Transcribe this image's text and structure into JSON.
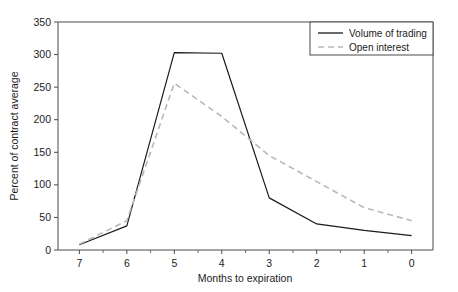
{
  "chart_data": {
    "type": "line",
    "title": "",
    "xlabel": "Months to expiration",
    "ylabel": "Percent of contract average",
    "x": [
      7,
      6,
      5,
      4,
      3,
      2,
      1,
      0
    ],
    "categories": [
      "7",
      "6",
      "5",
      "4",
      "3",
      "2",
      "1",
      "0"
    ],
    "xlim": [
      7.45,
      -0.45
    ],
    "ylim": [
      0,
      350
    ],
    "x_ticks": [
      "7",
      "6",
      "5",
      "4",
      "3",
      "2",
      "1",
      "0"
    ],
    "y_ticks": [
      "0",
      "50",
      "100",
      "150",
      "200",
      "250",
      "300",
      "350"
    ],
    "x_axis_inverted": true,
    "grid": false,
    "legend_position": "top-right",
    "minor_ticks_x": true,
    "series": [
      {
        "name": "Volume of trading",
        "style": "solid",
        "color": "#1a1a1a",
        "values": [
          8,
          37,
          303,
          302,
          80,
          40,
          30,
          22
        ]
      },
      {
        "name": "Open interest",
        "style": "dashed",
        "color": "#b8b8b8",
        "values": [
          9,
          45,
          256,
          205,
          145,
          105,
          65,
          45
        ]
      }
    ]
  },
  "legend": {
    "items": [
      {
        "label": "Volume of trading",
        "style": "solid",
        "color": "#1a1a1a"
      },
      {
        "label": "Open interest",
        "style": "dashed",
        "color": "#b8b8b8"
      }
    ]
  },
  "axes": {
    "y_title": "Percent of contract average",
    "x_title": "Months to expiration",
    "y_tick_labels": [
      "350",
      "300",
      "250",
      "200",
      "150",
      "100",
      "50",
      "0"
    ],
    "x_tick_labels": [
      "7",
      "6",
      "5",
      "4",
      "3",
      "2",
      "1",
      "0"
    ]
  }
}
